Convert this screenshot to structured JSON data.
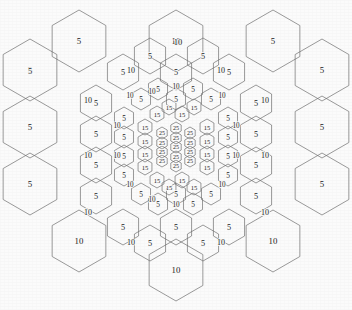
{
  "figure": {
    "width": 352,
    "height": 310,
    "background_color": "#fbfbfb",
    "stroke_color": "#6e6e6e",
    "text_color": "#1a1a1a"
  },
  "chart_data": {
    "type": "heatmap",
    "xlabel": "",
    "ylabel": "",
    "grid": true,
    "legend": "none",
    "levels": [
      {
        "name": "level-1-outer",
        "value": 5,
        "cell_radius": 30.0,
        "count": 12
      },
      {
        "name": "level-1-outer-corner",
        "value": 10,
        "cell_radius": 30.0,
        "count": 3
      },
      {
        "name": "level-2",
        "value": 5,
        "cell_radius": 18.0,
        "count": 12
      },
      {
        "name": "level-2-edge",
        "value": 10,
        "cell_radius": 18.0,
        "count": 12
      },
      {
        "name": "level-3",
        "value": 5,
        "cell_radius": 11.0,
        "count": 18
      },
      {
        "name": "level-3-edge",
        "value": 10,
        "cell_radius": 11.0,
        "count": 12
      },
      {
        "name": "level-4",
        "value": 15,
        "cell_radius": 7.0,
        "count": 18
      },
      {
        "name": "level-5-core",
        "value": 25,
        "cell_radius": 5.0,
        "count": 19
      }
    ],
    "value_domain": [
      5,
      10,
      15,
      25
    ],
    "cells": [
      {
        "cx": 30,
        "cy": 70,
        "r": 31,
        "orient": "pointy",
        "label": "5"
      },
      {
        "cx": 30,
        "cy": 127,
        "r": 31,
        "orient": "pointy",
        "label": "5"
      },
      {
        "cx": 30,
        "cy": 184,
        "r": 31,
        "orient": "pointy",
        "label": "5"
      },
      {
        "cx": 79,
        "cy": 41,
        "r": 31,
        "orient": "pointy",
        "label": "5"
      },
      {
        "cx": 79,
        "cy": 241,
        "r": 31,
        "orient": "pointy",
        "label": "10"
      },
      {
        "cx": 176,
        "cy": 41,
        "r": 31,
        "orient": "pointy",
        "label": "10"
      },
      {
        "cx": 176,
        "cy": 270,
        "r": 31,
        "orient": "pointy",
        "label": "10"
      },
      {
        "cx": 273,
        "cy": 41,
        "r": 31,
        "orient": "pointy",
        "label": "5"
      },
      {
        "cx": 273,
        "cy": 241,
        "r": 31,
        "orient": "pointy",
        "label": "10"
      },
      {
        "cx": 322,
        "cy": 70,
        "r": 31,
        "orient": "pointy",
        "label": "5"
      },
      {
        "cx": 322,
        "cy": 127,
        "r": 31,
        "orient": "pointy",
        "label": "5"
      },
      {
        "cx": 322,
        "cy": 184,
        "r": 31,
        "orient": "pointy",
        "label": "5"
      },
      {
        "cx": 96,
        "cy": 103,
        "r": 18,
        "orient": "pointy",
        "label": "5"
      },
      {
        "cx": 96,
        "cy": 134,
        "r": 18,
        "orient": "pointy",
        "label": "5"
      },
      {
        "cx": 96,
        "cy": 165,
        "r": 18,
        "orient": "pointy",
        "label": "5"
      },
      {
        "cx": 96,
        "cy": 196,
        "r": 18,
        "orient": "pointy",
        "label": "5"
      },
      {
        "cx": 123,
        "cy": 72,
        "r": 18,
        "orient": "pointy",
        "label": "5"
      },
      {
        "cx": 123,
        "cy": 227,
        "r": 18,
        "orient": "pointy",
        "label": "5"
      },
      {
        "cx": 150,
        "cy": 56,
        "r": 18,
        "orient": "pointy",
        "label": "5"
      },
      {
        "cx": 150,
        "cy": 243,
        "r": 18,
        "orient": "pointy",
        "label": "5"
      },
      {
        "cx": 176,
        "cy": 72,
        "r": 18,
        "orient": "pointy",
        "label": "5"
      },
      {
        "cx": 176,
        "cy": 227,
        "r": 18,
        "orient": "pointy",
        "label": "5"
      },
      {
        "cx": 203,
        "cy": 56,
        "r": 18,
        "orient": "pointy",
        "label": "5"
      },
      {
        "cx": 203,
        "cy": 243,
        "r": 18,
        "orient": "pointy",
        "label": "5"
      },
      {
        "cx": 229,
        "cy": 72,
        "r": 18,
        "orient": "pointy",
        "label": "5"
      },
      {
        "cx": 229,
        "cy": 227,
        "r": 18,
        "orient": "pointy",
        "label": "5"
      },
      {
        "cx": 256,
        "cy": 103,
        "r": 18,
        "orient": "pointy",
        "label": "5"
      },
      {
        "cx": 256,
        "cy": 134,
        "r": 18,
        "orient": "pointy",
        "label": "5"
      },
      {
        "cx": 256,
        "cy": 165,
        "r": 18,
        "orient": "pointy",
        "label": "5"
      },
      {
        "cx": 256,
        "cy": 196,
        "r": 18,
        "orient": "pointy",
        "label": "5"
      },
      {
        "cx": 124,
        "cy": 118,
        "r": 11,
        "orient": "pointy",
        "label": "5"
      },
      {
        "cx": 124,
        "cy": 137,
        "r": 11,
        "orient": "pointy",
        "label": "5"
      },
      {
        "cx": 124,
        "cy": 156,
        "r": 11,
        "orient": "pointy",
        "label": "5"
      },
      {
        "cx": 124,
        "cy": 175,
        "r": 11,
        "orient": "pointy",
        "label": "5"
      },
      {
        "cx": 141,
        "cy": 99,
        "r": 11,
        "orient": "pointy",
        "label": "5"
      },
      {
        "cx": 141,
        "cy": 194,
        "r": 11,
        "orient": "pointy",
        "label": "5"
      },
      {
        "cx": 158,
        "cy": 89,
        "r": 11,
        "orient": "pointy",
        "label": "5"
      },
      {
        "cx": 158,
        "cy": 204,
        "r": 11,
        "orient": "pointy",
        "label": "5"
      },
      {
        "cx": 176,
        "cy": 99,
        "r": 11,
        "orient": "pointy",
        "label": "5"
      },
      {
        "cx": 176,
        "cy": 194,
        "r": 11,
        "orient": "pointy",
        "label": "5"
      },
      {
        "cx": 193,
        "cy": 89,
        "r": 11,
        "orient": "pointy",
        "label": "5"
      },
      {
        "cx": 193,
        "cy": 204,
        "r": 11,
        "orient": "pointy",
        "label": "5"
      },
      {
        "cx": 211,
        "cy": 99,
        "r": 11,
        "orient": "pointy",
        "label": "5"
      },
      {
        "cx": 211,
        "cy": 194,
        "r": 11,
        "orient": "pointy",
        "label": "5"
      },
      {
        "cx": 228,
        "cy": 118,
        "r": 11,
        "orient": "pointy",
        "label": "5"
      },
      {
        "cx": 228,
        "cy": 137,
        "r": 11,
        "orient": "pointy",
        "label": "5"
      },
      {
        "cx": 228,
        "cy": 156,
        "r": 11,
        "orient": "pointy",
        "label": "5"
      },
      {
        "cx": 228,
        "cy": 175,
        "r": 11,
        "orient": "pointy",
        "label": "5"
      },
      {
        "cx": 145,
        "cy": 127,
        "r": 8,
        "orient": "pointy",
        "label": "15"
      },
      {
        "cx": 145,
        "cy": 141,
        "r": 8,
        "orient": "pointy",
        "label": "15"
      },
      {
        "cx": 145,
        "cy": 154,
        "r": 8,
        "orient": "pointy",
        "label": "15"
      },
      {
        "cx": 145,
        "cy": 167,
        "r": 8,
        "orient": "pointy",
        "label": "15"
      },
      {
        "cx": 157,
        "cy": 114,
        "r": 8,
        "orient": "pointy",
        "label": "15"
      },
      {
        "cx": 157,
        "cy": 180,
        "r": 8,
        "orient": "pointy",
        "label": "15"
      },
      {
        "cx": 169,
        "cy": 107,
        "r": 8,
        "orient": "pointy",
        "label": "15"
      },
      {
        "cx": 169,
        "cy": 187,
        "r": 8,
        "orient": "pointy",
        "label": "15"
      },
      {
        "cx": 182,
        "cy": 114,
        "r": 8,
        "orient": "pointy",
        "label": "15"
      },
      {
        "cx": 182,
        "cy": 180,
        "r": 8,
        "orient": "pointy",
        "label": "15"
      },
      {
        "cx": 194,
        "cy": 107,
        "r": 8,
        "orient": "pointy",
        "label": "15"
      },
      {
        "cx": 194,
        "cy": 187,
        "r": 8,
        "orient": "pointy",
        "label": "15"
      },
      {
        "cx": 207,
        "cy": 127,
        "r": 8,
        "orient": "pointy",
        "label": "15"
      },
      {
        "cx": 207,
        "cy": 141,
        "r": 8,
        "orient": "pointy",
        "label": "15"
      },
      {
        "cx": 207,
        "cy": 154,
        "r": 8,
        "orient": "pointy",
        "label": "15"
      },
      {
        "cx": 207,
        "cy": 167,
        "r": 8,
        "orient": "pointy",
        "label": "15"
      },
      {
        "cx": 162,
        "cy": 133,
        "r": 6,
        "orient": "pointy",
        "label": "25"
      },
      {
        "cx": 162,
        "cy": 143,
        "r": 6,
        "orient": "pointy",
        "label": "25"
      },
      {
        "cx": 162,
        "cy": 152,
        "r": 6,
        "orient": "pointy",
        "label": "25"
      },
      {
        "cx": 162,
        "cy": 161,
        "r": 6,
        "orient": "pointy",
        "label": "25"
      },
      {
        "cx": 176,
        "cy": 128,
        "r": 6,
        "orient": "pointy",
        "label": "25"
      },
      {
        "cx": 176,
        "cy": 138,
        "r": 6,
        "orient": "pointy",
        "label": "25"
      },
      {
        "cx": 176,
        "cy": 147,
        "r": 6,
        "orient": "pointy",
        "label": "25"
      },
      {
        "cx": 176,
        "cy": 157,
        "r": 6,
        "orient": "pointy",
        "label": "25"
      },
      {
        "cx": 176,
        "cy": 166,
        "r": 6,
        "orient": "pointy",
        "label": "25"
      },
      {
        "cx": 190,
        "cy": 133,
        "r": 6,
        "orient": "pointy",
        "label": "25"
      },
      {
        "cx": 190,
        "cy": 143,
        "r": 6,
        "orient": "pointy",
        "label": "25"
      },
      {
        "cx": 190,
        "cy": 152,
        "r": 6,
        "orient": "pointy",
        "label": "25"
      },
      {
        "cx": 190,
        "cy": 161,
        "r": 6,
        "orient": "pointy",
        "label": "25"
      }
    ],
    "boundary_labels": [
      {
        "x": 178,
        "y": 42,
        "text": "10",
        "size": 8.5
      },
      {
        "x": 30,
        "y": 71,
        "text": "5",
        "size": 8.5
      },
      {
        "x": 131,
        "y": 70,
        "text": "10",
        "size": 8.0
      },
      {
        "x": 221,
        "y": 70,
        "text": "10",
        "size": 8.0
      },
      {
        "x": 88,
        "y": 100,
        "text": "10",
        "size": 8.0
      },
      {
        "x": 265,
        "y": 100,
        "text": "10",
        "size": 8.0
      },
      {
        "x": 88,
        "y": 155,
        "text": "10",
        "size": 8.0
      },
      {
        "x": 265,
        "y": 155,
        "text": "10",
        "size": 8.0
      },
      {
        "x": 88,
        "y": 212,
        "text": "10",
        "size": 8.0
      },
      {
        "x": 265,
        "y": 212,
        "text": "10",
        "size": 8.0
      },
      {
        "x": 131,
        "y": 242,
        "text": "10",
        "size": 8.0
      },
      {
        "x": 221,
        "y": 242,
        "text": "10",
        "size": 8.0
      },
      {
        "x": 130,
        "y": 96,
        "text": "10",
        "size": 7.2
      },
      {
        "x": 222,
        "y": 96,
        "text": "10",
        "size": 7.2
      },
      {
        "x": 117,
        "y": 126,
        "text": "10",
        "size": 7.2
      },
      {
        "x": 236,
        "y": 126,
        "text": "10",
        "size": 7.2
      },
      {
        "x": 117,
        "y": 156,
        "text": "10",
        "size": 7.2
      },
      {
        "x": 236,
        "y": 156,
        "text": "10",
        "size": 7.2
      },
      {
        "x": 130,
        "y": 185,
        "text": "10",
        "size": 7.2
      },
      {
        "x": 222,
        "y": 185,
        "text": "10",
        "size": 7.2
      },
      {
        "x": 176,
        "y": 87,
        "text": "10",
        "size": 7.2
      },
      {
        "x": 176,
        "y": 205,
        "text": "10",
        "size": 7.2
      },
      {
        "x": 152,
        "y": 200,
        "text": "10",
        "size": 7.2
      },
      {
        "x": 152,
        "y": 92,
        "text": "10",
        "size": 7.2
      }
    ]
  }
}
